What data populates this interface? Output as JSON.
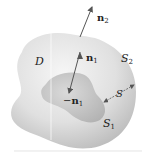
{
  "diagram": {
    "type": "region between two closed surfaces",
    "labels": {
      "region": "D",
      "outer_surface": "S",
      "outer_surface_sub": "2",
      "inner_surface": "S",
      "inner_surface_sub": "1",
      "gap_surface": "S",
      "outer_normal": "n",
      "outer_normal_sub": "2",
      "inner_normal": "n",
      "inner_normal_sub": "1",
      "neg_inner_normal_prefix": "−",
      "neg_inner_normal": "n",
      "neg_inner_normal_sub": "1"
    },
    "colors": {
      "outer_fill_light": "#f2f2f2",
      "outer_fill_dark": "#c4c4c4",
      "inner_fill_light": "#d8d8d8",
      "inner_fill_dark": "#b4b4b4",
      "arrow": "#555555",
      "text": "#222222"
    }
  }
}
